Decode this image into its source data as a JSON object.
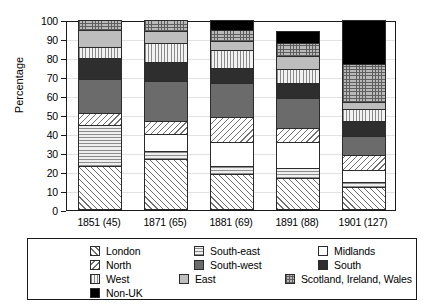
{
  "chart_data": {
    "type": "bar",
    "stacked": true,
    "title": "",
    "xlabel": "",
    "ylabel": "Percentage",
    "ylim": [
      0,
      100
    ],
    "yticks": [
      0,
      10,
      20,
      30,
      40,
      50,
      60,
      70,
      80,
      90,
      100
    ],
    "grid": true,
    "legend_position": "bottom",
    "categories": [
      "1851 (45)",
      "1871 (65)",
      "1881 (69)",
      "1891 (88)",
      "1901 (127)"
    ],
    "series": [
      {
        "name": "London",
        "pattern": "diagonal-hatch-up",
        "values": [
          23,
          27,
          19,
          17,
          12
        ]
      },
      {
        "name": "South-east",
        "pattern": "horizontal-lines",
        "values": [
          22,
          4,
          4,
          5,
          3
        ]
      },
      {
        "name": "Midlands",
        "pattern": "solid-white",
        "values": [
          0,
          9,
          13,
          14,
          6
        ]
      },
      {
        "name": "North",
        "pattern": "diagonal-hatch-down",
        "values": [
          6,
          7,
          13,
          7,
          8
        ]
      },
      {
        "name": "South-west",
        "pattern": "solid-dark-gray",
        "values": [
          18,
          21,
          18,
          16,
          10
        ]
      },
      {
        "name": "South",
        "pattern": "solid-near-black",
        "values": [
          11,
          10,
          8,
          8,
          8
        ]
      },
      {
        "name": "West",
        "pattern": "vertical-lines",
        "values": [
          6,
          10,
          9,
          7,
          6
        ]
      },
      {
        "name": "East",
        "pattern": "solid-light-gray",
        "values": [
          9,
          6,
          5,
          7,
          4
        ]
      },
      {
        "name": "Scotland, Ireland, Wales",
        "pattern": "cross-grid",
        "values": [
          5,
          6,
          6,
          7,
          20
        ]
      },
      {
        "name": "Non-UK",
        "pattern": "solid-black",
        "values": [
          0,
          0,
          5,
          6,
          23
        ]
      }
    ],
    "colors": {
      "london": "#ffffff",
      "south_east": "#efefef",
      "midlands": "#ffffff",
      "north": "#ffffff",
      "south_west": "#6b6b6b",
      "south": "#2e2e2e",
      "west": "#f2f2f2",
      "east": "#bdbdbd",
      "scotland_ireland_wales": "#b9b9b9",
      "non_uk": "#000000",
      "axis": "#1a1a1a",
      "grid": "#e2e2e2"
    }
  },
  "legend": {
    "rows": [
      [
        {
          "label": "London",
          "key": "london"
        },
        {
          "label": "South-east",
          "key": "south_east"
        },
        {
          "label": "Midlands",
          "key": "midlands"
        }
      ],
      [
        {
          "label": "North",
          "key": "north"
        },
        {
          "label": "South-west",
          "key": "south_west"
        },
        {
          "label": "South",
          "key": "south"
        }
      ],
      [
        {
          "label": "West",
          "key": "west"
        },
        {
          "label": "East",
          "key": "east"
        },
        {
          "label": "Scotland, Ireland, Wales",
          "key": "scotland_ireland_wales"
        }
      ],
      [
        {
          "label": "Non-UK",
          "key": "non_uk"
        }
      ]
    ]
  }
}
